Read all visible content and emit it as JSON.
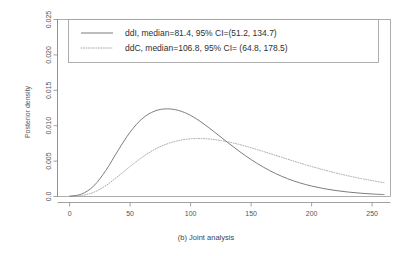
{
  "chart_data": {
    "type": "line",
    "title": "",
    "caption": "(b) Joint analysis",
    "xlabel": "",
    "ylabel": "Posterior density",
    "xlim": [
      -10,
      265
    ],
    "ylim": [
      0,
      0.025
    ],
    "grid": false,
    "legend_position": "top",
    "x_ticks": [
      0,
      50,
      100,
      150,
      200,
      250
    ],
    "x_tick_labels": [
      "0",
      "50",
      "100",
      "150",
      "200",
      "250"
    ],
    "y_ticks": [
      0,
      0.005,
      0.01,
      0.015,
      0.02,
      0.025
    ],
    "y_tick_labels": [
      "0.0",
      "0.005",
      "0.010",
      "0.015",
      "0.020",
      "0.025"
    ],
    "series": [
      {
        "name": "ddI",
        "legend_label": "ddI, median=81.4, 95% CI=(51.2, 134.7)",
        "style": "solid",
        "color": "#6e6e6e",
        "median": 81.4,
        "ci_low": 51.2,
        "ci_high": 134.7,
        "peak_x": 85,
        "peak_y": 0.0124,
        "x": [
          0,
          10,
          20,
          30,
          40,
          50,
          60,
          70,
          80,
          90,
          100,
          110,
          120,
          130,
          140,
          150,
          160,
          170,
          180,
          190,
          200,
          210,
          220,
          230,
          240,
          250,
          260
        ],
        "y": [
          5e-05,
          0.00035,
          0.0015,
          0.0037,
          0.0065,
          0.0091,
          0.011,
          0.01205,
          0.01238,
          0.01215,
          0.01145,
          0.01035,
          0.00905,
          0.0077,
          0.0064,
          0.0052,
          0.00415,
          0.00325,
          0.00252,
          0.00193,
          0.00147,
          0.00111,
          0.00084,
          0.00063,
          0.00047,
          0.00035,
          0.00027
        ]
      },
      {
        "name": "ddC",
        "legend_label": "ddC, median=106.8, 95% CI= (64.8, 178.5)",
        "style": "dotted",
        "color": "#9e9e9e",
        "median": 106.8,
        "ci_low": 64.8,
        "ci_high": 178.5,
        "peak_x": 106,
        "peak_y": 0.0082,
        "x": [
          0,
          10,
          20,
          30,
          40,
          50,
          60,
          70,
          80,
          90,
          100,
          110,
          120,
          130,
          140,
          150,
          160,
          170,
          180,
          190,
          200,
          210,
          220,
          230,
          240,
          250,
          260
        ],
        "y": [
          2e-05,
          0.00012,
          0.0006,
          0.00155,
          0.00285,
          0.00425,
          0.00555,
          0.00663,
          0.0074,
          0.0079,
          0.00815,
          0.00818,
          0.00803,
          0.00775,
          0.00735,
          0.00688,
          0.00636,
          0.00582,
          0.00527,
          0.00474,
          0.00423,
          0.00376,
          0.00332,
          0.00292,
          0.00256,
          0.00224,
          0.00195
        ]
      }
    ]
  }
}
